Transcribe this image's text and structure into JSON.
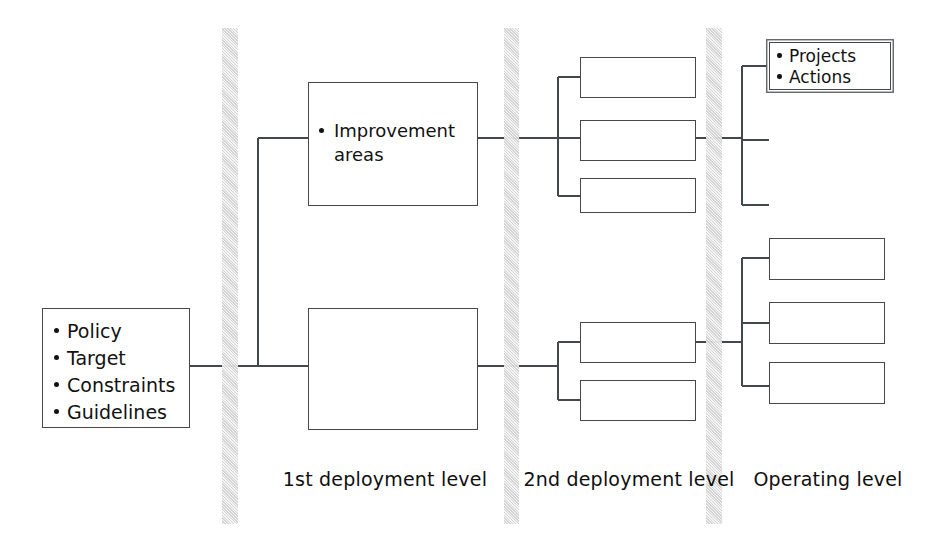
{
  "diagram": {
    "background_color": "#ffffff",
    "line_color": "#44474b",
    "band_color": "#d2d2d2"
  },
  "nodes": {
    "policy": {
      "items": [
        "Policy",
        "Target",
        "Constraints",
        "Guidelines"
      ]
    },
    "improvement": {
      "items": [
        "Improvement areas"
      ]
    },
    "projects": {
      "items": [
        "Projects",
        "Actions"
      ]
    },
    "blank": {
      "label": ""
    }
  },
  "labels": {
    "level_1": "1st deployment level",
    "level_2": "2nd deployment level",
    "level_3": "Operating level"
  },
  "bands": [
    {
      "name": "band-1",
      "x": 222
    },
    {
      "name": "band-2",
      "x": 504
    },
    {
      "name": "band-3",
      "x": 706
    }
  ]
}
